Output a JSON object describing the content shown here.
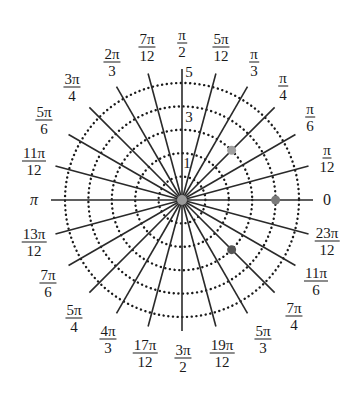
{
  "diagram": {
    "type": "polar-grid",
    "center": [
      182,
      200
    ],
    "ring_spacing_px": 23.4,
    "rings": [
      1,
      2,
      3,
      4,
      5
    ],
    "ring_labels": [
      {
        "value": "1",
        "x": 187,
        "y": 163
      },
      {
        "value": "3",
        "x": 189,
        "y": 117
      },
      {
        "value": "5",
        "x": 189,
        "y": 72
      }
    ],
    "radial_line_length_px": 131,
    "angle_step": "π/12",
    "angle_labels": [
      {
        "angle_deg": 0,
        "num": "0",
        "den": "",
        "x": 327,
        "y": 200
      },
      {
        "angle_deg": 15,
        "num": "π",
        "den": "12",
        "x": 327,
        "y": 158
      },
      {
        "angle_deg": 30,
        "num": "π",
        "den": "6",
        "x": 310,
        "y": 117
      },
      {
        "angle_deg": 45,
        "num": "π",
        "den": "4",
        "x": 283,
        "y": 86
      },
      {
        "angle_deg": 60,
        "num": "π",
        "den": "3",
        "x": 254,
        "y": 62
      },
      {
        "angle_deg": 75,
        "num": "5π",
        "den": "12",
        "x": 221,
        "y": 47
      },
      {
        "angle_deg": 90,
        "num": "π",
        "den": "2",
        "x": 182,
        "y": 43
      },
      {
        "angle_deg": 105,
        "num": "7π",
        "den": "12",
        "x": 147,
        "y": 47
      },
      {
        "angle_deg": 120,
        "num": "2π",
        "den": "3",
        "x": 112,
        "y": 62
      },
      {
        "angle_deg": 135,
        "num": "3π",
        "den": "4",
        "x": 72,
        "y": 87
      },
      {
        "angle_deg": 150,
        "num": "5π",
        "den": "6",
        "x": 44,
        "y": 120
      },
      {
        "angle_deg": 165,
        "num": "11π",
        "den": "12",
        "x": 34,
        "y": 161
      },
      {
        "angle_deg": 180,
        "num": "π",
        "den": "",
        "x": 34,
        "y": 200
      },
      {
        "angle_deg": 195,
        "num": "13π",
        "den": "12",
        "x": 34,
        "y": 242
      },
      {
        "angle_deg": 210,
        "num": "7π",
        "den": "6",
        "x": 48,
        "y": 283
      },
      {
        "angle_deg": 225,
        "num": "5π",
        "den": "4",
        "x": 74,
        "y": 318
      },
      {
        "angle_deg": 240,
        "num": "4π",
        "den": "3",
        "x": 108,
        "y": 339
      },
      {
        "angle_deg": 255,
        "num": "17π",
        "den": "12",
        "x": 145,
        "y": 353
      },
      {
        "angle_deg": 270,
        "num": "3π",
        "den": "2",
        "x": 183,
        "y": 358
      },
      {
        "angle_deg": 285,
        "num": "19π",
        "den": "12",
        "x": 222,
        "y": 353
      },
      {
        "angle_deg": 300,
        "num": "5π",
        "den": "3",
        "x": 263,
        "y": 339
      },
      {
        "angle_deg": 315,
        "num": "7π",
        "den": "4",
        "x": 294,
        "y": 316
      },
      {
        "angle_deg": 330,
        "num": "11π",
        "den": "6",
        "x": 316,
        "y": 281
      },
      {
        "angle_deg": 345,
        "num": "23π",
        "den": "12",
        "x": 327,
        "y": 241
      }
    ],
    "points": [
      {
        "r": 0,
        "angle_deg": 0,
        "label": "pole",
        "color": "#9a9a9a"
      },
      {
        "r": 4,
        "angle_deg": 0,
        "label": "(4, 0)",
        "color": "#7a7a7a"
      },
      {
        "r": 3,
        "angle_deg": 45,
        "label": "(3, π/4)",
        "color": "#a0a0a0"
      },
      {
        "r": 3,
        "angle_deg": 315,
        "label": "(3, 7π/4)",
        "color": "#555555"
      }
    ],
    "colors": {
      "line": "#2a2a2a",
      "ring_dots": "#1a1a1a",
      "background": "#ffffff"
    }
  }
}
